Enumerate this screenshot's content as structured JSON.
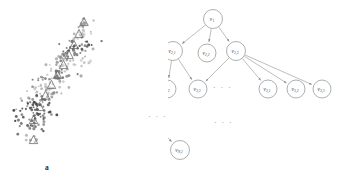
{
  "figure": {
    "panels": [
      {
        "id": "a",
        "caption": "a",
        "type": "scatter",
        "description": "scatter plot of gray point clusters with triangle centroid markers arranged along a diagonal"
      },
      {
        "id": "b",
        "caption": "b",
        "type": "tree",
        "description": "hierarchical tree diagram of cluster nodes"
      }
    ]
  },
  "chart_data": {
    "type": "scatter",
    "title": "",
    "xlabel": "",
    "ylabel": "",
    "grid": false,
    "legend": null,
    "axis_visible": false,
    "xlim": [
      0,
      168
    ],
    "ylim": [
      0,
      184
    ],
    "marker_shapes": [
      "point",
      "triangle"
    ],
    "clusters": [
      {
        "id": 1,
        "centroid": [
          84.0,
          24.0
        ],
        "color": "#9b9b9b",
        "n_points": 14,
        "spread": [
          5.5,
          2.0
        ],
        "angle": -22
      },
      {
        "id": 2,
        "centroid": [
          79.0,
          36.0
        ],
        "color": "#b4b4b4",
        "n_points": 16,
        "spread": [
          6.5,
          2.2
        ],
        "angle": -18
      },
      {
        "id": 3,
        "centroid": [
          73.5,
          47.0
        ],
        "color": "#4a4a4a",
        "n_points": 30,
        "spread": [
          9.5,
          3.0
        ],
        "angle": -12
      },
      {
        "id": 4,
        "centroid": [
          69.0,
          56.5
        ],
        "color": "#7c7c7c",
        "n_points": 26,
        "spread": [
          10.5,
          2.8
        ],
        "angle": -14
      },
      {
        "id": 5,
        "centroid": [
          63.0,
          66.5
        ],
        "color": "#c2c2c2",
        "n_points": 24,
        "spread": [
          11.0,
          2.8
        ],
        "angle": -12
      },
      {
        "id": 6,
        "centroid": [
          57.0,
          76.0
        ],
        "color": "#6e6e6e",
        "n_points": 28,
        "spread": [
          12.0,
          3.0
        ],
        "angle": -13
      },
      {
        "id": 7,
        "centroid": [
          51.0,
          86.0
        ],
        "color": "#b8b8b8",
        "n_points": 26,
        "spread": [
          12.5,
          3.2
        ],
        "angle": -12
      },
      {
        "id": 8,
        "centroid": [
          45.0,
          96.5
        ],
        "color": "#8f8f8f",
        "n_points": 28,
        "spread": [
          13.0,
          3.2
        ],
        "angle": -14
      },
      {
        "id": 9,
        "centroid": [
          39.0,
          108.0
        ],
        "color": "#3f3f3f",
        "n_points": 40,
        "spread": [
          11.0,
          5.0
        ],
        "angle": -8
      },
      {
        "id": 10,
        "centroid": [
          33.0,
          121.0
        ],
        "color": "#5a5a5a",
        "n_points": 34,
        "spread": [
          10.0,
          6.0
        ],
        "angle": -6
      },
      {
        "id": 11,
        "centroid": [
          33.5,
          140.0
        ],
        "color": "#a8a8a8",
        "n_points": 6,
        "spread": [
          3.0,
          2.0
        ],
        "angle": 0
      }
    ],
    "centroid_markers": [
      [
        84.0,
        22.0
      ],
      [
        79.0,
        34.0
      ],
      [
        74.0,
        45.0
      ],
      [
        69.0,
        55.0
      ],
      [
        63.5,
        65.0
      ],
      [
        57.5,
        75.0
      ],
      [
        51.5,
        85.0
      ],
      [
        45.5,
        95.5
      ],
      [
        39.5,
        107.0
      ],
      [
        33.5,
        120.0
      ],
      [
        33.5,
        140.0
      ]
    ]
  },
  "tree": {
    "caption": "b",
    "nodes": [
      {
        "key": "root",
        "name": "v",
        "sub": "1",
        "cx": 213,
        "cy": 19,
        "r": 9.5
      },
      {
        "key": "n21",
        "name": "v",
        "sub": "2,1",
        "cx": 173,
        "cy": 51,
        "r": 9.5
      },
      {
        "key": "n22",
        "name": "v",
        "sub": "2,2",
        "cx": 207,
        "cy": 53,
        "r": 9.0
      },
      {
        "key": "n23",
        "name": "v",
        "sub": "2,3",
        "cx": 236,
        "cy": 51,
        "r": 9.5
      },
      {
        "key": "n31",
        "name": "v",
        "sub": "3,1",
        "cx": 130,
        "cy": 89,
        "r": 9.0
      },
      {
        "key": "n32",
        "name": "v",
        "sub": "3,2",
        "cx": 167,
        "cy": 89,
        "r": 9.0
      },
      {
        "key": "n33",
        "name": "v",
        "sub": "3,3",
        "cx": 198,
        "cy": 89,
        "r": 9.0
      },
      {
        "key": "m31",
        "name": "v",
        "sub": "3,1",
        "cx": 268,
        "cy": 89,
        "r": 9.0
      },
      {
        "key": "m32",
        "name": "v",
        "sub": "3,2",
        "cx": 296,
        "cy": 89,
        "r": 9.0
      },
      {
        "key": "m33",
        "name": "v",
        "sub": "3,3",
        "cx": 322,
        "cy": 89,
        "r": 9.0
      },
      {
        "key": "nN1",
        "name": "v",
        "sub": "N,1",
        "cx": 133,
        "cy": 150,
        "r": 9.5
      },
      {
        "key": "nN2",
        "name": "v",
        "sub": "N,2",
        "cx": 180,
        "cy": 150,
        "r": 9.5
      }
    ],
    "edges": [
      [
        "root",
        "n21"
      ],
      [
        "root",
        "n22"
      ],
      [
        "root",
        "n23"
      ],
      [
        "n21",
        "n31"
      ],
      [
        "n21",
        "n32"
      ],
      [
        "n21",
        "n33"
      ],
      [
        "n23",
        "n33"
      ],
      [
        "n23",
        "m31"
      ],
      [
        "n23",
        "m32"
      ],
      [
        "n23",
        "m33"
      ],
      [
        "branch",
        "nN1"
      ],
      [
        "branch",
        "nN2"
      ]
    ],
    "branch_point": [
      157,
      127
    ],
    "ellipses": [
      {
        "name": "row3-gap",
        "text": "· · ·",
        "left": 213,
        "top": 84
      },
      {
        "name": "mid-vertical",
        "text": "· · ·",
        "left": 214,
        "top": 119
      },
      {
        "name": "above-branch",
        "text": "· · ·",
        "left": 148,
        "top": 113
      }
    ]
  }
}
